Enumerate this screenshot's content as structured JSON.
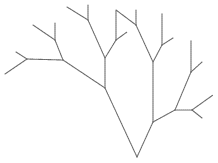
{
  "diagram": {
    "type": "fractal-tree",
    "stroke_color": "#6a6a6a",
    "background": "#ffffff",
    "root": [
      137,
      157
    ],
    "segments": [
      {
        "id": "trunk-left",
        "from": [
          137,
          157
        ],
        "to": [
          105,
          88
        ]
      },
      {
        "id": "trunk-right",
        "from": [
          137,
          157
        ],
        "to": [
          153,
          122
        ]
      },
      {
        "id": "left-diag",
        "from": [
          105,
          88
        ],
        "to": [
          63,
          60
        ]
      },
      {
        "id": "left-vert",
        "from": [
          105,
          88
        ],
        "to": [
          105,
          58
        ]
      },
      {
        "id": "far-left-horiz",
        "from": [
          63,
          60
        ],
        "to": [
          27,
          59
        ]
      },
      {
        "id": "far-left-up",
        "from": [
          27,
          59
        ],
        "to": [
          16,
          52
        ]
      },
      {
        "id": "far-left-down",
        "from": [
          27,
          59
        ],
        "to": [
          5,
          74
        ]
      },
      {
        "id": "upper-left-stem",
        "from": [
          63,
          60
        ],
        "to": [
          55,
          40
        ]
      },
      {
        "id": "upper-left-diag",
        "from": [
          55,
          40
        ],
        "to": [
          33,
          25
        ]
      },
      {
        "id": "upper-left-vert",
        "from": [
          55,
          40
        ],
        "to": [
          55,
          23
        ]
      },
      {
        "id": "mid-left-diag",
        "from": [
          105,
          58
        ],
        "to": [
          88,
          20
        ]
      },
      {
        "id": "top-left-diag",
        "from": [
          88,
          20
        ],
        "to": [
          67,
          7
        ]
      },
      {
        "id": "top-left-vert",
        "from": [
          88,
          20
        ],
        "to": [
          88,
          5
        ]
      },
      {
        "id": "mid-right-stem",
        "from": [
          105,
          58
        ],
        "to": [
          116,
          40
        ]
      },
      {
        "id": "mid-vert",
        "from": [
          116,
          40
        ],
        "to": [
          116,
          10
        ]
      },
      {
        "id": "mid-twig",
        "from": [
          116,
          40
        ],
        "to": [
          127,
          32
        ]
      },
      {
        "id": "top-mid-diag",
        "from": [
          116,
          10
        ],
        "to": [
          136,
          25
        ]
      },
      {
        "id": "top-mid-vert",
        "from": [
          136,
          25
        ],
        "to": [
          136,
          10
        ]
      },
      {
        "id": "center-diag",
        "from": [
          136,
          25
        ],
        "to": [
          153,
          62
        ]
      },
      {
        "id": "right-vert",
        "from": [
          153,
          122
        ],
        "to": [
          153,
          62
        ]
      },
      {
        "id": "right-upper-stem",
        "from": [
          153,
          62
        ],
        "to": [
          162,
          45
        ]
      },
      {
        "id": "right-upper-vert",
        "from": [
          162,
          45
        ],
        "to": [
          162,
          13
        ]
      },
      {
        "id": "right-upper-twig",
        "from": [
          162,
          45
        ],
        "to": [
          173,
          38
        ]
      },
      {
        "id": "right-low-diag",
        "from": [
          153,
          122
        ],
        "to": [
          175,
          110
        ]
      },
      {
        "id": "right-low-stem",
        "from": [
          175,
          110
        ],
        "to": [
          191,
          72
        ]
      },
      {
        "id": "far-right-vert",
        "from": [
          191,
          72
        ],
        "to": [
          191,
          40
        ]
      },
      {
        "id": "far-right-twig",
        "from": [
          191,
          72
        ],
        "to": [
          202,
          62
        ]
      },
      {
        "id": "right-horiz",
        "from": [
          175,
          110
        ],
        "to": [
          192,
          110
        ]
      },
      {
        "id": "right-fork-up",
        "from": [
          192,
          110
        ],
        "to": [
          213,
          95
        ]
      },
      {
        "id": "right-fork-down",
        "from": [
          192,
          110
        ],
        "to": [
          202,
          118
        ]
      }
    ]
  }
}
